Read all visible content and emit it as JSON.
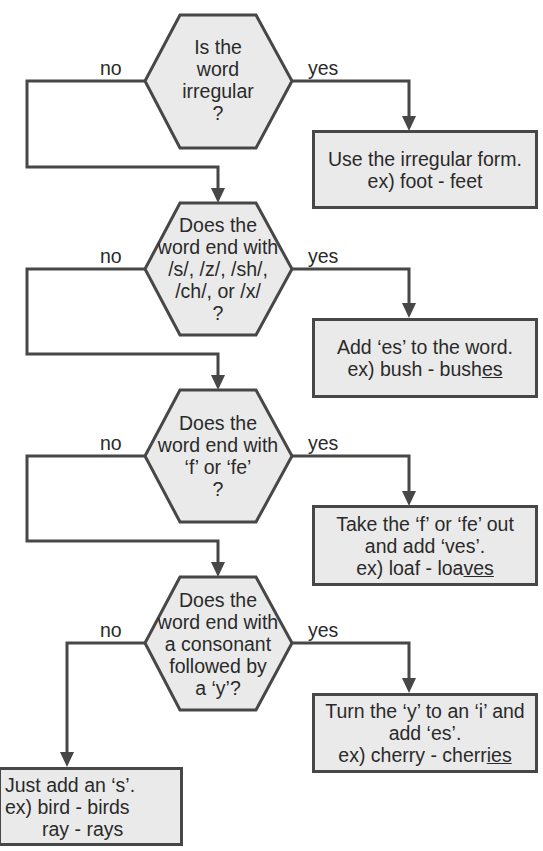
{
  "colors": {
    "stroke": "#474747",
    "fill": "#eaeaea",
    "text": "#2a2a2a"
  },
  "labels": {
    "no": "no",
    "yes": "yes"
  },
  "decisions": [
    {
      "lines": [
        "Is the",
        "word",
        "irregular",
        "?"
      ]
    },
    {
      "lines": [
        "Does the",
        "word end with",
        "/s/, /z/, /sh/,",
        "/ch/, or /x/",
        "?"
      ]
    },
    {
      "lines": [
        "Does the",
        "word end with",
        "‘f’ or ‘fe’",
        "?"
      ]
    },
    {
      "lines": [
        "Does the",
        "word end with",
        "a consonant",
        "followed by",
        "a ‘y’?"
      ]
    }
  ],
  "outcomes": [
    {
      "line1": "Use the irregular form.",
      "ex_prefix": "ex)  foot - feet",
      "ex_underline": ""
    },
    {
      "line1": "Add ‘es’ to the word.",
      "ex_prefix": "ex) bush - bush",
      "ex_underline": "es"
    },
    {
      "line1": "Take the ‘f’ or ‘fe’ out",
      "line2": "and add ‘ves’.",
      "ex_prefix": "ex) loaf - loa",
      "ex_underline": "ves"
    },
    {
      "line1": "Turn the ‘y’ to an ‘i’ and",
      "line2": "add ‘es’.",
      "ex_prefix": "ex) cherry - cherr",
      "ex_underline": "ies"
    },
    {
      "line1": "Just add an ‘s’.",
      "line2": "ex) bird - birds",
      "line3": "ray - rays"
    }
  ]
}
